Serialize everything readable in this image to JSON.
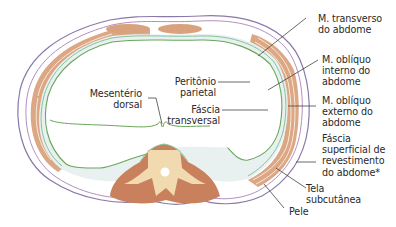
{
  "diagram": {
    "colors": {
      "muscle": "#d9a27e",
      "muscle_dark": "#c9805c",
      "skin_line": "#8a78a8",
      "fascia_line": "#b48fbf",
      "peritoneum_line": "#6aa65a",
      "transversalis_line": "#86c2a0",
      "fat_fill": "#e8f1f0",
      "vertebra": "#f1d9b0",
      "leader": "#444444"
    },
    "labels": {
      "transverso": "M. transverso\ndo abdome",
      "obliquo_interno": "M. oblíquo\ninterno do\nabdome",
      "obliquo_externo": "M. oblíquo\nexterno do\nabdome",
      "fascia_superficial": "Fáscia\nsuperficial de\nrevestimento\ndo abdome*",
      "tela_subcutanea": "Tela\nsubcutânea",
      "pele": "Pele",
      "peritonio": "Peritônio\nparietal",
      "fascia_transversal": "Fáscia\ntransversal",
      "mesenterio": "Mesentério\ndorsal"
    }
  }
}
